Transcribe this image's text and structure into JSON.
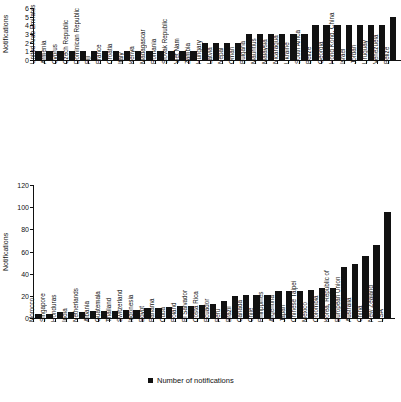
{
  "figure": {
    "background_color": "#ffffff",
    "bar_color": "#111111",
    "axis_color": "#111111"
  },
  "chart_data": [
    {
      "id": "top",
      "type": "bar",
      "title": "",
      "xlabel": "",
      "ylabel": "Notifications",
      "ylim": [
        0,
        6
      ],
      "yticks": [
        0,
        1,
        2,
        3,
        4,
        5,
        6
      ],
      "grid": false,
      "legend": null,
      "categories": [
        "United Arab Emirates",
        "Armenia",
        "Cyprus",
        "Czech Republic",
        "Dominican Republic",
        "Fiji",
        "France",
        "Croatia",
        "Italy",
        "Kenya",
        "Madagascar",
        "Romania",
        "Slovak Republic",
        "Viet Nam",
        "Zambia",
        "Hungary",
        "Latvia",
        "Nepal",
        "Oman",
        "Bulgaria",
        "Mauritius",
        "Malaysia",
        "Nicaragua",
        "Ukraine",
        "South Africa",
        "Belize",
        "Georgia",
        "Hong Kong, China",
        "Israel",
        "Jordan",
        "Uruguay",
        "Venezuela",
        "Belize"
      ],
      "values": [
        1,
        1,
        1,
        1,
        1,
        1,
        1,
        1,
        1,
        1,
        1,
        1,
        1,
        1,
        1,
        2,
        2,
        2,
        2,
        3,
        3,
        3,
        3,
        3,
        3,
        4,
        4,
        4,
        4,
        4,
        4,
        4,
        5
      ]
    },
    {
      "id": "bottom",
      "type": "bar",
      "title": "",
      "xlabel": "",
      "ylabel": "Notifications",
      "ylim": [
        0,
        120
      ],
      "yticks": [
        0,
        20,
        40,
        60,
        80,
        100,
        120
      ],
      "grid": false,
      "legend": {
        "label": "Number of notifications",
        "position": "bottom-center"
      },
      "categories": [
        "Morocco",
        "Singapore",
        "Honduras",
        "India",
        "Netherlands",
        "Albania",
        "Guatemala",
        "Thailand",
        "Switzerland",
        "Indonesia",
        "Egypt",
        "Panama",
        "Cuba",
        "Poland",
        "El Salvador",
        "Costa Rica",
        "Ecuador",
        "Peru",
        "Brazil",
        "Canada",
        "Chile",
        "Philippines",
        "Argentina",
        "Japan",
        "Chinese Taipei",
        "Mexico",
        "Colombia",
        "Korea, Republic of",
        "European Union",
        "Australia",
        "China",
        "New Zealand",
        "USA"
      ],
      "values": [
        4,
        4,
        5,
        5,
        5,
        6,
        6,
        6,
        7,
        7,
        9,
        9,
        10,
        11,
        11,
        12,
        13,
        15,
        20,
        21,
        21,
        21,
        24,
        24,
        24,
        25,
        27,
        27,
        46,
        49,
        56,
        66,
        96
      ]
    }
  ]
}
